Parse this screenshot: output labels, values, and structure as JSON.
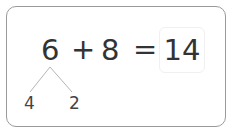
{
  "equation": {
    "addend1": "6",
    "operator": "+",
    "addend2": "8",
    "equals": "=",
    "answer": "14"
  },
  "decomposition": {
    "of": "6",
    "parts": [
      "4",
      "2"
    ]
  },
  "colors": {
    "text": "#333333",
    "card_border": "#9a9a9a",
    "branch_line": "#b5b5b5",
    "answer_box_border": "#f0f0f0"
  }
}
